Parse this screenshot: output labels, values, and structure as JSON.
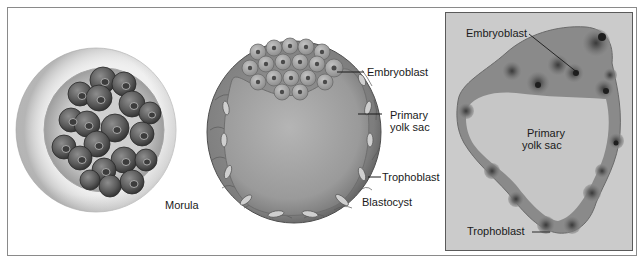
{
  "figure": {
    "panels": [
      {
        "id": "morula",
        "type": "illustration",
        "caption": "Morula",
        "labels": []
      },
      {
        "id": "blastocyst",
        "type": "illustration",
        "caption": "Blastocyst",
        "labels": [
          "Embryoblast",
          "Primary yolk sac",
          "Trophoblast"
        ]
      },
      {
        "id": "micrograph",
        "type": "photomicrograph",
        "caption": "",
        "labels": [
          "Embryoblast",
          "Primary yolk sac",
          "Trophoblast"
        ]
      }
    ]
  },
  "morula": {
    "caption": "Morula"
  },
  "blastocyst": {
    "caption": "Blastocyst",
    "embryoblast": "Embryoblast",
    "yolk_sac_line1": "Primary",
    "yolk_sac_line2": "yolk sac",
    "trophoblast": "Trophoblast"
  },
  "micrograph": {
    "embryoblast": "Embryoblast",
    "yolk_sac_line1": "Primary",
    "yolk_sac_line2": "yolk sac",
    "trophoblast": "Trophoblast"
  },
  "colors": {
    "background": "#ffffff",
    "frame": "#8a8a8a",
    "cell_dark": "#4a4a4a",
    "cell_mid": "#7a7a7a",
    "zona": "#e2e2e2",
    "cavity": "#a8a8a8",
    "micro_bg": "#c9c9c9",
    "text": "#1a1a1a"
  }
}
